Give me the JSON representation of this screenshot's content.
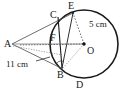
{
  "figure": {
    "kind": "circle-geometry-diagram",
    "width": 127,
    "height": 92,
    "background_color": "#ffffff",
    "stroke_color": "#1a1a1a",
    "thin_stroke_color": "#555555",
    "points": [
      {
        "id": "A",
        "label": "A",
        "x": 12,
        "y": 44,
        "label_x": 4,
        "label_y": 39,
        "on_circle": false
      },
      {
        "id": "B",
        "label": "B",
        "x": 62,
        "y": 68,
        "label_x": 57,
        "label_y": 70,
        "on_circle": true
      },
      {
        "id": "C",
        "label": "C",
        "x": 58,
        "y": 17,
        "label_x": 50,
        "label_y": 10,
        "on_circle": true
      },
      {
        "id": "D",
        "label": "D",
        "x": 80,
        "y": 78,
        "label_x": 76,
        "label_y": 80,
        "on_circle": true
      },
      {
        "id": "E",
        "label": "E",
        "x": 73,
        "y": 13,
        "label_x": 68,
        "label_y": 1,
        "on_circle": true
      },
      {
        "id": "F",
        "label": "F",
        "x": 57,
        "y": 40,
        "label_x": 50,
        "label_y": 33,
        "on_circle": false
      },
      {
        "id": "O",
        "label": "O",
        "x": 84,
        "y": 44,
        "label_x": 87,
        "label_y": 46,
        "on_circle": false,
        "is_center": true
      }
    ],
    "circle": {
      "cx": 84,
      "cy": 44,
      "r": 34
    },
    "measurements": [
      {
        "id": "radius-oe",
        "text": "5 cm",
        "x": 89,
        "y": 20,
        "segment": "OE"
      },
      {
        "id": "chord-ab",
        "text": "11 cm",
        "x": 6,
        "y": 60,
        "segment": "AB"
      }
    ],
    "leader_line": {
      "from_x": 36,
      "from_y": 61,
      "to_x": 50,
      "to_y": 57
    },
    "angle_mark": {
      "cx": 60,
      "cy": 63,
      "r": 5
    }
  }
}
